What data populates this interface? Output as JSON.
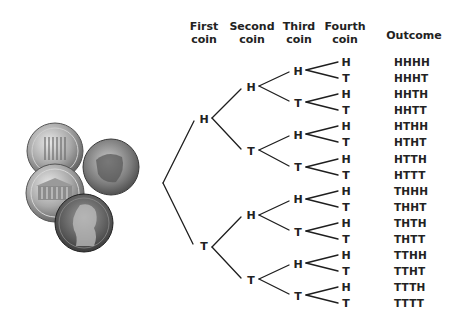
{
  "headers": {
    "first": [
      "First",
      "coin"
    ],
    "second": [
      "Second",
      "coin"
    ],
    "third": [
      "Third",
      "coin"
    ],
    "fourth": [
      "Fourth",
      "coin"
    ],
    "outcome": "Outcome"
  },
  "tree": {
    "level1": [
      "H",
      "T"
    ],
    "level2": [
      "H",
      "T",
      "H",
      "T"
    ],
    "level3": [
      "H",
      "T",
      "H",
      "T",
      "H",
      "T",
      "H",
      "T"
    ],
    "level4": [
      "H",
      "T",
      "H",
      "T",
      "H",
      "T",
      "H",
      "T",
      "H",
      "T",
      "H",
      "T",
      "H",
      "T",
      "H",
      "T"
    ]
  },
  "outcomes": [
    "HHHH",
    "HHHT",
    "HHTH",
    "HHTT",
    "HTHH",
    "HTHT",
    "HTTH",
    "HTTT",
    "THHH",
    "THHT",
    "THTH",
    "THTT",
    "TTHH",
    "TTHT",
    "TTTH",
    "TTTT"
  ],
  "image": {
    "subject": "four-pennies-photo",
    "coins": [
      "penny-memorial-reverse",
      "penny-lincoln-head-tilted",
      "penny-memorial-reverse",
      "penny-lincoln-head"
    ]
  }
}
